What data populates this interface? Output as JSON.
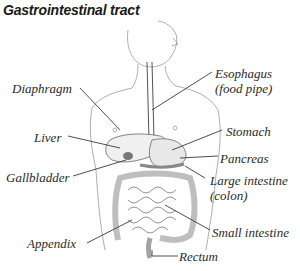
{
  "title": "Gastrointestinal tract",
  "labels": {
    "diaphragm": "Diaphragm",
    "esophagus_line1": "Esophagus",
    "esophagus_line2": "(food pipe)",
    "liver": "Liver",
    "stomach": "Stomach",
    "pancreas": "Pancreas",
    "gallbladder": "Gallbladder",
    "large_intestine_line1": "Large intestine",
    "large_intestine_line2": "(colon)",
    "small_intestine": "Small intestine",
    "appendix": "Appendix",
    "rectum": "Rectum"
  },
  "colors": {
    "line": "#3a3a3a",
    "sketch": "#9a9a9a",
    "organ_shade": "#b8b8b8"
  }
}
